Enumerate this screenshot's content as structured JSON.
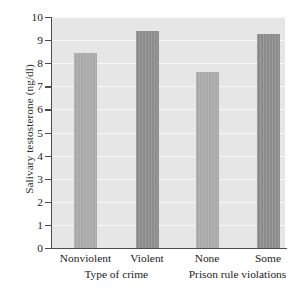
{
  "chart_data": {
    "type": "bar",
    "title": "",
    "xlabel": "",
    "ylabel": "Salivary testosterone (ng/dl)",
    "categories": [
      "Nonviolent",
      "Violent",
      "None",
      "Some"
    ],
    "values": [
      8.45,
      9.4,
      7.6,
      9.25
    ],
    "ylim": [
      0,
      10
    ],
    "yticks": [
      0,
      1,
      2,
      3,
      4,
      5,
      6,
      7,
      8,
      9,
      10
    ],
    "ytick_labels": [
      "0",
      "1",
      "2",
      "3",
      "4",
      "5",
      "6",
      "7",
      "8",
      "9",
      "10"
    ],
    "grid": true,
    "legend": "none",
    "groups": [
      {
        "label": "Type of crime",
        "categories": [
          "Nonviolent",
          "Violent"
        ]
      },
      {
        "label": "Prison rule violations",
        "categories": [
          "None",
          "Some"
        ]
      }
    ],
    "bar_colors": [
      "#a9a9a9",
      "#8c8c8c",
      "#a9a9a9",
      "#8c8c8c"
    ],
    "plot_background": "#e6e6e6",
    "gridline_color": "#f7f7f7",
    "axis_color": "#4d4d4d"
  }
}
